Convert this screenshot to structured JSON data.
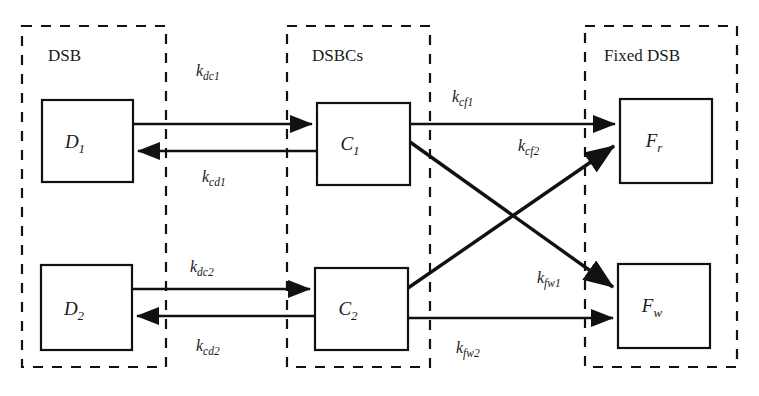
{
  "diagram": {
    "type": "compartment-flow-diagram",
    "colors": {
      "stroke": "#111111",
      "background": "#ffffff",
      "text": "#1a1a1a"
    },
    "groups": [
      {
        "id": "dsb",
        "label": "DSB",
        "x": 22,
        "y": 26,
        "width": 144,
        "height": 341
      },
      {
        "id": "dsbcs",
        "label": "DSBCs",
        "x": 287,
        "y": 26,
        "width": 143,
        "height": 341
      },
      {
        "id": "fixed_dsb",
        "label": "Fixed DSB",
        "x": 585,
        "y": 26,
        "width": 152,
        "height": 341
      }
    ],
    "nodes": [
      {
        "id": "d1",
        "base": "D",
        "sub": "1",
        "x": 42,
        "y": 100,
        "width": 91,
        "height": 82,
        "group": "dsb"
      },
      {
        "id": "d2",
        "base": "D",
        "sub": "2",
        "x": 41,
        "y": 265,
        "width": 91,
        "height": 85,
        "group": "dsb"
      },
      {
        "id": "c1",
        "base": "C",
        "sub": "1",
        "x": 317,
        "y": 103,
        "width": 93,
        "height": 82,
        "group": "dsbcs"
      },
      {
        "id": "c2",
        "base": "C",
        "sub": "2",
        "x": 315,
        "y": 268,
        "width": 93,
        "height": 82,
        "group": "dsbcs"
      },
      {
        "id": "fr",
        "base": "F",
        "sub": "r",
        "x": 620,
        "y": 99,
        "width": 92,
        "height": 84,
        "group": "fixed_dsb"
      },
      {
        "id": "fw",
        "base": "F",
        "sub": "w",
        "x": 618,
        "y": 264,
        "width": 92,
        "height": 84,
        "group": "fixed_dsb"
      }
    ],
    "edges": [
      {
        "id": "dc1",
        "from": "d1",
        "to": "c1",
        "base": "k",
        "sub": "dc1",
        "x1": 133,
        "y1": 124,
        "x2": 317,
        "y2": 124,
        "label_x": 213,
        "label_y": 76,
        "direction": "right"
      },
      {
        "id": "cd1",
        "from": "c1",
        "to": "d1",
        "base": "k",
        "sub": "cd1",
        "x1": 317,
        "y1": 151,
        "x2": 133,
        "y2": 151,
        "label_x": 218,
        "label_y": 182,
        "direction": "left"
      },
      {
        "id": "dc2",
        "from": "d2",
        "to": "c2",
        "base": "k",
        "sub": "dc2",
        "x1": 132,
        "y1": 289,
        "x2": 315,
        "y2": 289,
        "label_x": 203,
        "label_y": 272,
        "direction": "right"
      },
      {
        "id": "cd2",
        "from": "c2",
        "to": "d2",
        "base": "k",
        "sub": "cd2",
        "x1": 315,
        "y1": 316,
        "x2": 132,
        "y2": 316,
        "label_x": 208,
        "label_y": 350,
        "direction": "left"
      },
      {
        "id": "cf1",
        "from": "c1",
        "to": "fr",
        "base": "k",
        "sub": "cf1",
        "x1": 410,
        "y1": 124,
        "x2": 620,
        "y2": 124,
        "label_x": 468,
        "label_y": 102,
        "direction": "right"
      },
      {
        "id": "cf2",
        "from": "c2",
        "to": "fr",
        "base": "k",
        "sub": "cf2",
        "x1": 408,
        "y1": 288,
        "x2": 618,
        "y2": 143,
        "label_x": 519,
        "label_y": 148,
        "direction": "diagonal-up"
      },
      {
        "id": "fw1",
        "from": "c1",
        "to": "fw",
        "base": "k",
        "sub": "fw1",
        "x1": 410,
        "y1": 142,
        "x2": 617,
        "y2": 290,
        "label_x": 540,
        "label_y": 281,
        "direction": "diagonal-down"
      },
      {
        "id": "fw2",
        "from": "c2",
        "to": "fw",
        "base": "k",
        "sub": "fw2",
        "x1": 408,
        "y1": 318,
        "x2": 618,
        "y2": 318,
        "label_x": 470,
        "label_y": 352,
        "direction": "right"
      }
    ]
  }
}
